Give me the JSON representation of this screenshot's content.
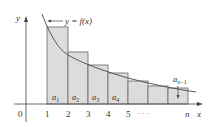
{
  "diagram": {
    "type": "integral-test-rectangles",
    "curve_label": "y = f(x)",
    "axis_labels": {
      "y": "y",
      "x": "x",
      "origin": "0"
    },
    "x_ticks": [
      "1",
      "2",
      "3",
      "4",
      "5",
      "· · ·",
      "n"
    ],
    "bar_labels": [
      "a1",
      "a2",
      "a3",
      "a4"
    ],
    "callout_label": "a n−1",
    "colors": {
      "bar_fill": "#dcdcdc",
      "stroke": "#555555",
      "text": "#333333"
    }
  }
}
